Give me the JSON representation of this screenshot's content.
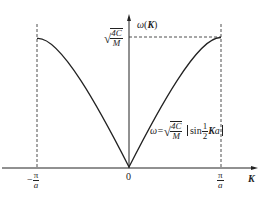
{
  "diagram": {
    "y_axis_label": {
      "omega": "ω",
      "open": "(",
      "K": "K",
      "close": ")"
    },
    "x_axis_label": "K",
    "ticks": {
      "left": {
        "sign": "−",
        "num": "π",
        "den": "a"
      },
      "origin": "0",
      "right": {
        "num": "π",
        "den": "a"
      }
    },
    "max_label": {
      "num": "4C",
      "den": "M"
    },
    "formula": {
      "lhs": "ω=",
      "sqrt_num": "4C",
      "sqrt_den": "M",
      "sin": "sin",
      "half_num": "1",
      "half_den": "2",
      "K": "K",
      "a": "a"
    },
    "colors": {
      "line": "#222222",
      "background": "#ffffff"
    }
  }
}
